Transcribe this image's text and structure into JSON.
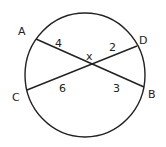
{
  "diagram": {
    "type": "circle-intersecting-chords",
    "colors": {
      "stroke": "#222222",
      "background": "#ffffff"
    },
    "circle": {
      "cx": 85,
      "cy": 75,
      "rx": 60,
      "ry": 62
    },
    "intersection": {
      "name": "X",
      "label": "x",
      "x": 91,
      "y": 64
    },
    "points": [
      {
        "name": "A",
        "label": "A",
        "x": 36,
        "y": 39
      },
      {
        "name": "B",
        "label": "B",
        "x": 144,
        "y": 87
      },
      {
        "name": "C",
        "label": "C",
        "x": 27,
        "y": 90
      },
      {
        "name": "D",
        "label": "D",
        "x": 137,
        "y": 46
      }
    ],
    "chords": [
      {
        "name": "AB",
        "from": "A",
        "to": "B"
      },
      {
        "name": "CD",
        "from": "C",
        "to": "D"
      }
    ],
    "segments": [
      {
        "name": "AX",
        "label": "4"
      },
      {
        "name": "XD",
        "label": "2"
      },
      {
        "name": "CX",
        "label": "6"
      },
      {
        "name": "XB",
        "label": "3"
      }
    ]
  }
}
